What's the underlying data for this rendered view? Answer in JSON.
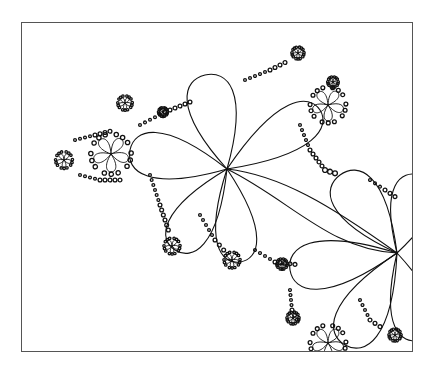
{
  "figure": {
    "background": "#ffffff",
    "stroke_color": "#111111",
    "frame_color": "#555555",
    "frame": {
      "x": 21,
      "y": 22,
      "width": 392,
      "height": 330
    },
    "centers": [
      {
        "name": "main",
        "x": 227,
        "y": 169,
        "petals": 5,
        "size": 1.0
      },
      {
        "name": "right",
        "x": 397,
        "y": 253,
        "petals": 5,
        "size": 1.0
      },
      {
        "name": "left",
        "x": 111,
        "y": 154,
        "petals": 5,
        "size": 0.45
      },
      {
        "name": "top-right",
        "x": 328,
        "y": 105,
        "petals": 5,
        "size": 0.4
      },
      {
        "name": "bottom",
        "x": 328,
        "y": 343,
        "petals": 5,
        "size": 0.4
      },
      {
        "name": "far-left",
        "x": 64,
        "y": 160,
        "petals": 5,
        "size": 0.18
      },
      {
        "name": "top-left",
        "x": 125,
        "y": 103,
        "petals": 5,
        "size": 0.15
      },
      {
        "name": "lower-left",
        "x": 172,
        "y": 246,
        "petals": 5,
        "size": 0.17
      },
      {
        "name": "lower-mid",
        "x": 232,
        "y": 260,
        "petals": 5,
        "size": 0.17
      },
      {
        "name": "top-right-small",
        "x": 298,
        "y": 53,
        "petals": 5,
        "size": 0.12
      },
      {
        "name": "right-upper-small",
        "x": 333,
        "y": 82,
        "petals": 5,
        "size": 0.1
      },
      {
        "name": "right-lower-small",
        "x": 395,
        "y": 335,
        "petals": 5,
        "size": 0.12
      },
      {
        "name": "bottom-left-small",
        "x": 293,
        "y": 318,
        "petals": 5,
        "size": 0.12
      },
      {
        "name": "mid-small-1",
        "x": 282,
        "y": 264,
        "petals": 5,
        "size": 0.1
      },
      {
        "name": "mid-small-2",
        "x": 163,
        "y": 112,
        "petals": 5,
        "size": 0.08
      }
    ]
  }
}
